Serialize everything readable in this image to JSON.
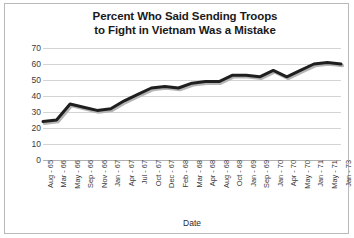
{
  "chart_data": {
    "type": "line",
    "title": "Percent Who Said Sending Troops to Fight in Vietnam Was a Mistake",
    "title_line1": "Percent Who Said Sending Troops",
    "title_line2": "to Fight in Vietnam Was a Mistake",
    "xlabel": "Date",
    "ylabel": "",
    "ylim": [
      0,
      70
    ],
    "yticks": [
      70,
      60,
      50,
      40,
      30,
      20,
      10,
      0
    ],
    "grid": true,
    "legend": false,
    "line_color": "#1f1f1f",
    "categories": [
      "Aug - 65",
      "Mar - 66",
      "May - 66",
      "Sep - 66",
      "Nov - 66",
      "Jan - 67",
      "Apr - 67",
      "Jul - 67",
      "Oct - 67",
      "Dec - 67",
      "Feb - 68",
      "Mar - 68",
      "Apr - 68",
      "Aug - 68",
      "Oct - 68",
      "Jan - 69",
      "Sep - 69",
      "Jan - 70",
      "Apr - 70",
      "May - 70",
      "Jan - 71",
      "May - 71",
      "Jan - 73"
    ],
    "values": [
      24,
      25,
      35,
      33,
      31,
      32,
      37,
      41,
      45,
      46,
      45,
      48,
      49,
      49,
      53,
      53,
      52,
      56,
      52,
      56,
      60,
      61,
      60
    ]
  }
}
